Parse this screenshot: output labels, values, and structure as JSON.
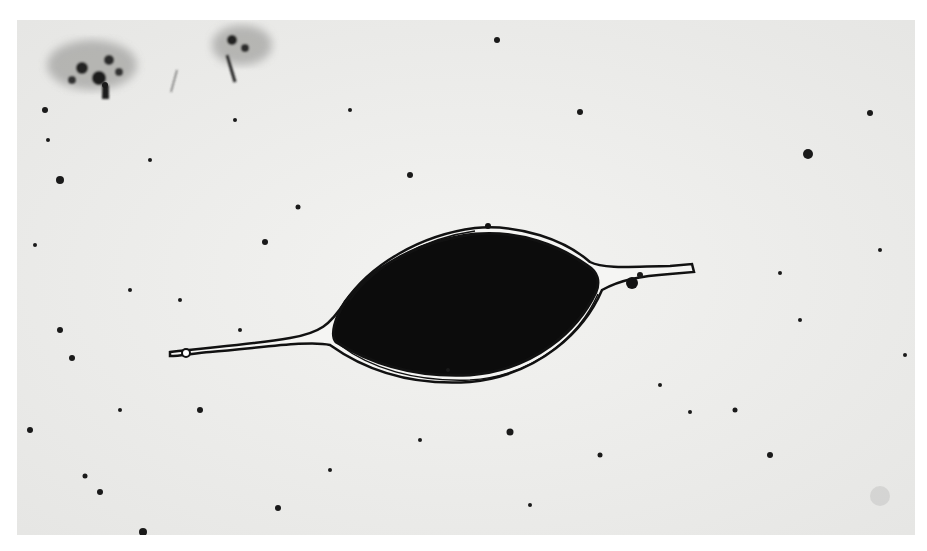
{
  "image": {
    "description": "Grayscale light micrograph of a dark spindle/lens-shaped body with thin tapering processes on each side, scattered debris particles on a pale background",
    "colors": {
      "background": "#eeeeec",
      "border": "#ffffff",
      "body": "#0c0c0c",
      "debris": "#1a1a1a"
    }
  }
}
